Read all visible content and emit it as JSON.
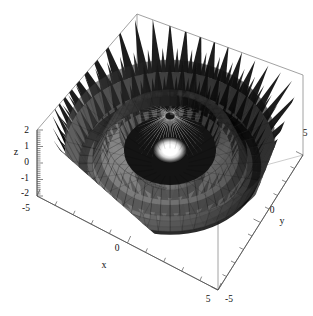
{
  "figure": {
    "title": "",
    "background_color": "#ffffff",
    "box_line_color": "#8a8a8a",
    "surface_color_dark": "#111111",
    "surface_color_mid": "#6e6e6e",
    "surface_color_light": "#ffffff"
  },
  "axes": {
    "x": {
      "label": "x",
      "tick_labels": [
        "-5",
        "0",
        "5"
      ],
      "range": [
        -5,
        5
      ]
    },
    "y": {
      "label": "y",
      "tick_labels": [
        "-5",
        "0",
        "5"
      ],
      "range": [
        -5,
        5
      ]
    },
    "z": {
      "label": "z",
      "tick_labels": [
        "2",
        "1",
        "0",
        "-1",
        "-2"
      ],
      "range": [
        -2,
        2
      ]
    }
  },
  "chart_data": {
    "type": "surface3d",
    "title": "",
    "xlabel": "x",
    "ylabel": "y",
    "zlabel": "z",
    "xlim": [
      -5,
      5
    ],
    "ylim": [
      -5,
      5
    ],
    "zlim": [
      -2,
      2
    ],
    "xticks": [
      -5,
      0,
      5
    ],
    "yticks": [
      -5,
      0,
      5
    ],
    "zticks": [
      -2,
      -1,
      0,
      1,
      2
    ],
    "grid": false,
    "legend": false,
    "colormap": "grayscale",
    "radial_profile_r": [
      0.0,
      0.25,
      0.5,
      0.75,
      1.0,
      1.25,
      1.5,
      1.75,
      2.0,
      2.25,
      2.5,
      2.75,
      3.0,
      3.25,
      3.5,
      3.75,
      4.0,
      4.25,
      4.5,
      4.75,
      5.0
    ],
    "radial_profile_z": [
      2.0,
      1.55,
      0.72,
      -0.25,
      -1.05,
      -1.5,
      -1.35,
      -0.72,
      0.05,
      0.78,
      1.2,
      1.25,
      0.88,
      0.28,
      -0.38,
      -0.9,
      -1.15,
      -1.0,
      -0.52,
      0.12,
      0.72
    ],
    "angular_spike_count": 48,
    "concentric_ring_count": 5,
    "center_peak_value": 2.0,
    "max_value": 2.0,
    "min_value": -2.0
  }
}
